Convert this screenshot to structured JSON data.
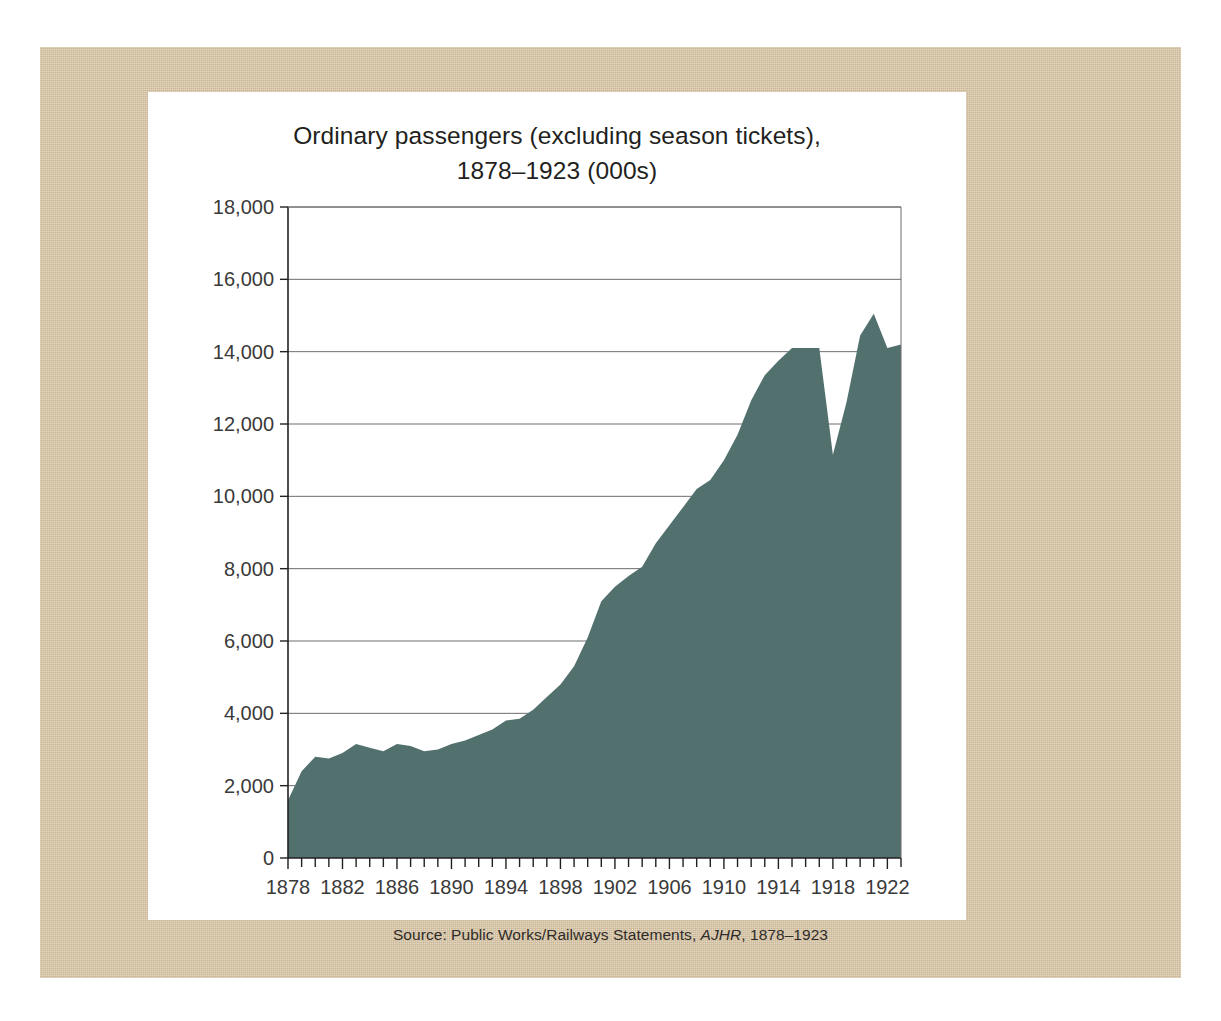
{
  "figure": {
    "title_line1": "Ordinary passengers (excluding season tickets),",
    "title_line2": "1878–1923 (000s)",
    "source_prefix": "Source: Public Works/Railways Statements, ",
    "source_italic": "AJHR",
    "source_suffix": ", 1878–1923",
    "mat_color": "#d7c4a3",
    "card_color": "#ffffff",
    "series_color": "#52706e",
    "axis_color": "#231f20",
    "grid_color": "#6d6d6d"
  },
  "chart_data": {
    "type": "area",
    "title": "Ordinary passengers (excluding season tickets), 1878–1923 (000s)",
    "xlabel": "",
    "ylabel": "",
    "ylim": [
      0,
      18000
    ],
    "xlim": [
      1878,
      1923
    ],
    "grid": true,
    "legend": "none",
    "units": "thousands of passengers",
    "y_ticks": [
      0,
      2000,
      4000,
      6000,
      8000,
      10000,
      12000,
      14000,
      16000,
      18000
    ],
    "y_tick_labels": [
      "0",
      "2,000",
      "4,000",
      "6,000",
      "8,000",
      "10,000",
      "12,000",
      "14,000",
      "16,000",
      "18,000"
    ],
    "x_ticks": [
      1878,
      1882,
      1886,
      1890,
      1894,
      1898,
      1902,
      1906,
      1910,
      1914,
      1918,
      1922
    ],
    "x_tick_labels": [
      "1878",
      "1882",
      "1886",
      "1890",
      "1894",
      "1898",
      "1902",
      "1906",
      "1910",
      "1914",
      "1918",
      "1922"
    ],
    "x_minor_tick_interval": 1,
    "x": [
      1878,
      1879,
      1880,
      1881,
      1882,
      1883,
      1884,
      1885,
      1886,
      1887,
      1888,
      1889,
      1890,
      1891,
      1892,
      1893,
      1894,
      1895,
      1896,
      1897,
      1898,
      1899,
      1900,
      1901,
      1902,
      1903,
      1904,
      1905,
      1906,
      1907,
      1908,
      1909,
      1910,
      1911,
      1912,
      1913,
      1914,
      1915,
      1916,
      1917,
      1918,
      1919,
      1920,
      1921,
      1922,
      1923
    ],
    "values": [
      1600,
      2400,
      2800,
      2750,
      2900,
      3150,
      3050,
      2950,
      3150,
      3100,
      2950,
      3000,
      3150,
      3250,
      3400,
      3550,
      3800,
      3850,
      4100,
      4450,
      4800,
      5300,
      6100,
      7100,
      7500,
      7800,
      8050,
      8700,
      9200,
      9700,
      10200,
      10450,
      11000,
      11700,
      12650,
      13350,
      13750,
      14100,
      14100,
      14100,
      11150,
      12600,
      14450,
      15050,
      14100,
      14200
    ],
    "series": [
      {
        "name": "Ordinary passengers (000s)",
        "color": "#52706e",
        "values": [
          1600,
          2400,
          2800,
          2750,
          2900,
          3150,
          3050,
          2950,
          3150,
          3100,
          2950,
          3000,
          3150,
          3250,
          3400,
          3550,
          3800,
          3850,
          4100,
          4450,
          4800,
          5300,
          6100,
          7100,
          7500,
          7800,
          8050,
          8700,
          9200,
          9700,
          10200,
          10450,
          11000,
          11700,
          12650,
          13350,
          13750,
          14100,
          14100,
          14100,
          11150,
          12600,
          14450,
          15050,
          14100,
          14200
        ]
      }
    ],
    "annotations": []
  }
}
